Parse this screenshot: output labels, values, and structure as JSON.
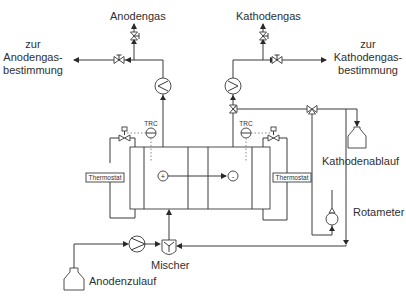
{
  "diagram": {
    "type": "process-flow",
    "labels": {
      "anode_gas": "Anodengas",
      "cathode_gas": "Kathodengas",
      "to_anode_gas_line1": "zur",
      "to_anode_gas_line2": "Anodengas-",
      "to_anode_gas_line3": "bestimmung",
      "to_cathode_gas_line1": "zur",
      "to_cathode_gas_line2": "Kathodengas-",
      "to_cathode_gas_line3": "bestimmung",
      "cathode_drain": "Kathodenablauf",
      "rotameter": "Rotameter",
      "mixer": "Mischer",
      "anode_feed": "Anodenzulauf",
      "thermostat_left": "Thermostat",
      "thermostat_right": "Thermostat",
      "trc_left": "TRC",
      "trc_right": "TRC",
      "plus": "+",
      "minus": "-"
    },
    "nodes": [
      {
        "id": "anode_gas_out",
        "label": "Anodengas"
      },
      {
        "id": "cathode_gas_out",
        "label": "Kathodengas"
      },
      {
        "id": "anode_analysis",
        "label": "zur Anodengas-bestimmung"
      },
      {
        "id": "cathode_analysis",
        "label": "zur Kathodengas-bestimmung"
      },
      {
        "id": "cooler_anode",
        "label": "heat exchanger"
      },
      {
        "id": "cooler_cathode",
        "label": "heat exchanger"
      },
      {
        "id": "cell_stack",
        "label": "cell (+ / -)"
      },
      {
        "id": "thermostat_left",
        "label": "Thermostat"
      },
      {
        "id": "thermostat_right",
        "label": "Thermostat"
      },
      {
        "id": "trc_left",
        "label": "TRC"
      },
      {
        "id": "trc_right",
        "label": "TRC"
      },
      {
        "id": "cathode_drain",
        "label": "Kathodenablauf"
      },
      {
        "id": "rotameter",
        "label": "Rotameter"
      },
      {
        "id": "pump",
        "label": "pump"
      },
      {
        "id": "mixer",
        "label": "Mischer"
      },
      {
        "id": "anode_feed",
        "label": "Anodenzulauf"
      }
    ],
    "edges": [
      {
        "from": "anode_feed",
        "to": "pump"
      },
      {
        "from": "pump",
        "to": "mixer"
      },
      {
        "from": "mixer",
        "to": "cell_stack"
      },
      {
        "from": "cell_stack",
        "to": "cooler_anode"
      },
      {
        "from": "cooler_anode",
        "to": "anode_gas_out"
      },
      {
        "from": "cooler_anode",
        "to": "anode_analysis"
      },
      {
        "from": "cell_stack",
        "to": "cooler_cathode"
      },
      {
        "from": "cooler_cathode",
        "to": "cathode_gas_out"
      },
      {
        "from": "cooler_cathode",
        "to": "cathode_analysis"
      },
      {
        "from": "cell_stack",
        "to": "cathode_drain"
      },
      {
        "from": "cell_stack",
        "to": "rotameter"
      },
      {
        "from": "rotameter",
        "to": "mixer"
      },
      {
        "from": "thermostat_left",
        "to": "cell_stack"
      },
      {
        "from": "thermostat_right",
        "to": "cell_stack"
      }
    ],
    "colors": {
      "line": "#3a3a3a",
      "background": "#ffffff",
      "text": "#2f2f2f"
    }
  }
}
